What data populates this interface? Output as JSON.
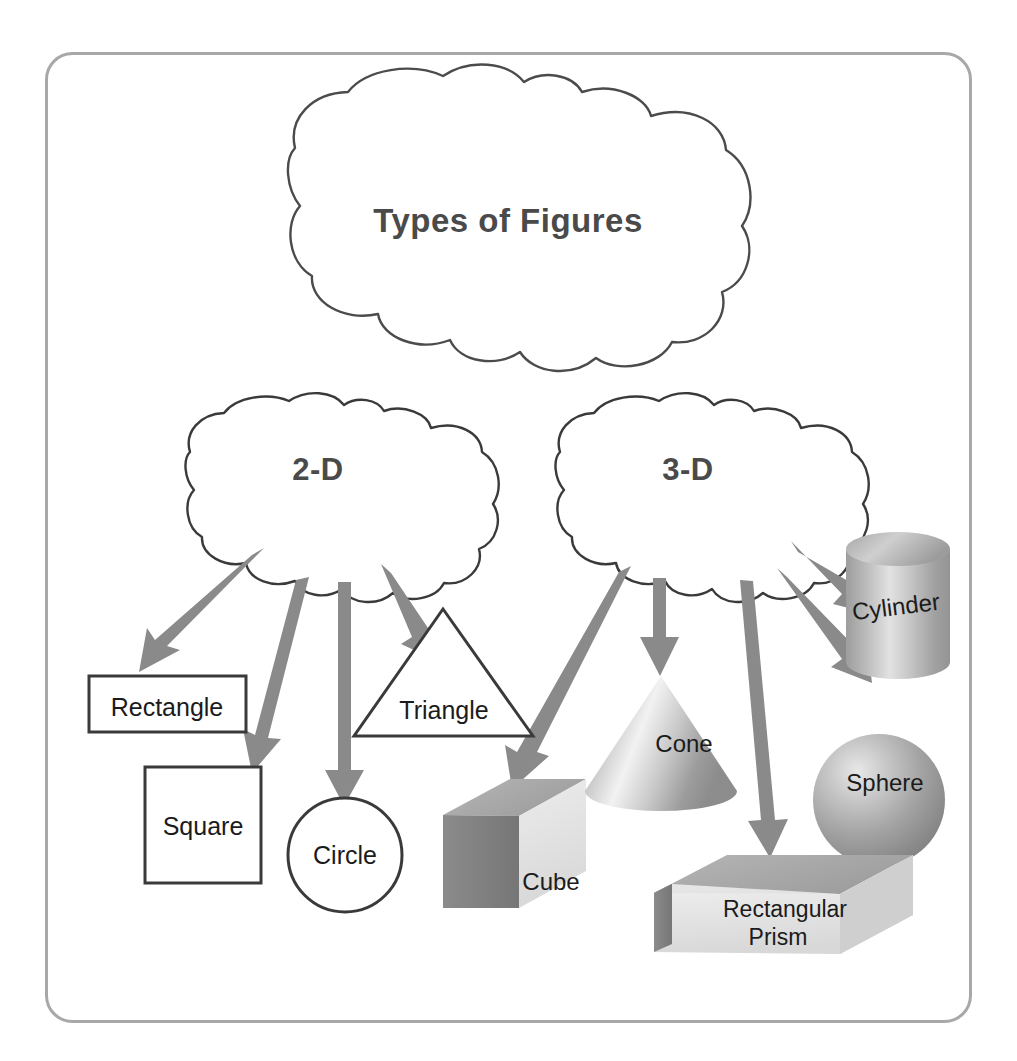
{
  "frame": {
    "border_color": "#a8a8a8",
    "background": "#ffffff"
  },
  "colors": {
    "arrow": "#8a8a8a",
    "cloud_outline": "#4b4b4b",
    "cloud_label": "#4a4a4a",
    "shape_outline": "#3a3a3a",
    "shape_label": "#1b1b1b",
    "solid_light": "#e3e3e3",
    "solid_mid": "#b4b4b4",
    "solid_dark": "#8f8f8f",
    "solid_darker": "#6f6f6f"
  },
  "diagram": {
    "type": "concept-map",
    "title": "Types of Figures",
    "root": {
      "label": "Types of Figures",
      "shape": "cloud"
    },
    "branches": [
      {
        "label": "2-D",
        "shape": "cloud",
        "children": [
          {
            "label": "Rectangle",
            "figure": "rectangle",
            "dimension": "2-D"
          },
          {
            "label": "Square",
            "figure": "square",
            "dimension": "2-D"
          },
          {
            "label": "Circle",
            "figure": "circle",
            "dimension": "2-D"
          },
          {
            "label": "Triangle",
            "figure": "triangle",
            "dimension": "2-D"
          }
        ]
      },
      {
        "label": "3-D",
        "shape": "cloud",
        "children": [
          {
            "label": "Cube",
            "figure": "cube",
            "dimension": "3-D"
          },
          {
            "label": "Cone",
            "figure": "cone",
            "dimension": "3-D"
          },
          {
            "label": "Cylinder",
            "figure": "cylinder",
            "dimension": "3-D"
          },
          {
            "label": "Sphere",
            "figure": "sphere",
            "dimension": "3-D"
          },
          {
            "label": "Rectangular Prism",
            "figure": "rectangular-prism",
            "dimension": "3-D",
            "label_line1": "Rectangular",
            "label_line2": "Prism"
          }
        ]
      }
    ],
    "arrow_count": 9,
    "caption": ""
  },
  "labels": {
    "title": "Types of Figures",
    "two_d": "2-D",
    "three_d": "3-D",
    "rectangle": "Rectangle",
    "square": "Square",
    "circle": "Circle",
    "triangle": "Triangle",
    "cube": "Cube",
    "cone": "Cone",
    "cylinder": "Cylinder",
    "sphere": "Sphere",
    "prism_line1": "Rectangular",
    "prism_line2": "Prism"
  }
}
